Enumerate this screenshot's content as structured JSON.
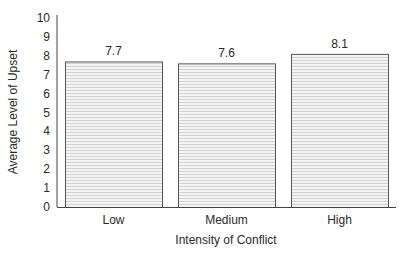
{
  "chart_data": {
    "type": "bar",
    "title": "",
    "xlabel": "Intensity of Conflict",
    "ylabel": "Average Level of Upset",
    "categories": [
      "Low",
      "Medium",
      "High"
    ],
    "values": [
      7.7,
      7.6,
      8.1
    ],
    "value_labels": [
      "7.7",
      "7.6",
      "8.1"
    ],
    "ylim": [
      0,
      10
    ],
    "yticks": [
      0,
      1,
      2,
      3,
      4,
      5,
      6,
      7,
      8,
      9,
      10
    ],
    "grid": false,
    "legend": null,
    "bar_fill": "horizontal-line-hatch",
    "colors": {
      "bar_fill": "#f2f2f2",
      "hatch": "#d4d4d4",
      "bar_edge": "#555555",
      "axis": "#444444"
    }
  }
}
